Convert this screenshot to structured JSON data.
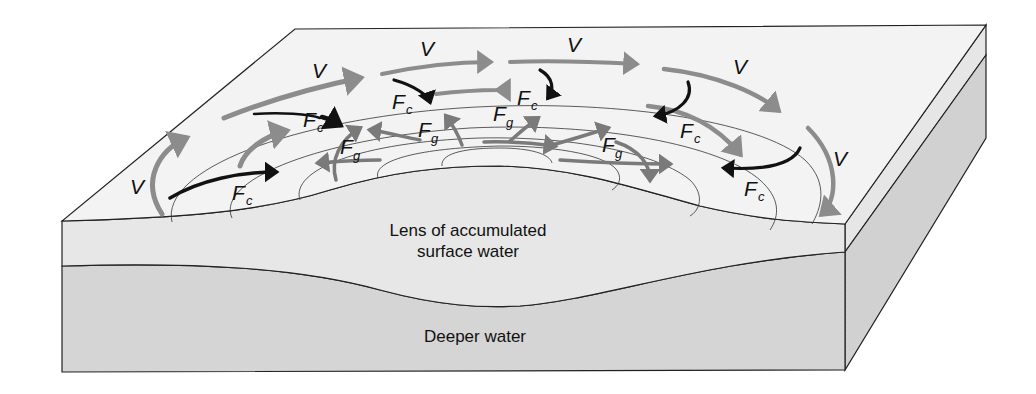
{
  "diagram": {
    "layers": {
      "surface_lens": "Lens of accumulated",
      "surface_lens_line2": "surface water",
      "deep": "Deeper water"
    },
    "symbols": {
      "velocity": "V",
      "coriolis": "F",
      "coriolis_sub": "c",
      "gravity": "F",
      "gravity_sub": "g"
    },
    "legend": {
      "V": "Current velocity (gray arrows)",
      "Fc": "Coriolis force (black arrows)",
      "Fg": "Gravitational / pressure-gradient force (gray arrows)"
    },
    "colors": {
      "top_face": "#f3f3f3",
      "lens_face": "#e8e8e8",
      "deep_face": "#d6d6d6",
      "side_face_top": "#e6e6e6",
      "side_face_deep": "#d2d2d2",
      "velocity_arrow": "#8c8c8c",
      "gravity_arrow": "#7f7f7f",
      "coriolis_arrow": "#111111",
      "outline": "#222222"
    }
  }
}
